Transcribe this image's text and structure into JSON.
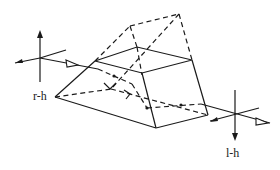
{
  "diagram": {
    "labels": {
      "left_axes": "r-h",
      "right_axes": "l-h"
    },
    "elements": [
      {
        "name": "prism-solid-edges",
        "style": "solid"
      },
      {
        "name": "prism-hidden-edges",
        "style": "dashed"
      },
      {
        "name": "beam-path-internal",
        "style": "dashed with arrowheads"
      },
      {
        "name": "input-axes",
        "label": "r-h"
      },
      {
        "name": "output-axes",
        "label": "l-h"
      }
    ],
    "colors": {
      "stroke": "#1a1a1a",
      "background": "#ffffff"
    }
  }
}
